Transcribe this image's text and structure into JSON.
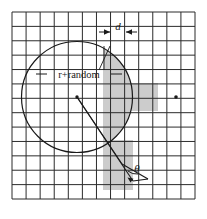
{
  "figure": {
    "name": "circle-sampling-diagram",
    "background_color": "#ffffff",
    "grid": {
      "x0": 12,
      "y0": 12,
      "x1": 195,
      "y1": 199,
      "columns": 13,
      "rows": 13,
      "cell_size": 14.08,
      "line_color": "#2b2b2b",
      "line_width": 1.0
    },
    "circle": {
      "center_x": 77,
      "center_y": 97,
      "radius": 55.5,
      "stroke_color": "#1a1a1a",
      "stroke_width": 1.1,
      "fill": "none"
    },
    "shaded_band": {
      "x_left": 103,
      "x_right": 133,
      "fill_color": "#c9c9c9",
      "description": "vertical strip of width d clipped to the circle and extended below"
    },
    "center_dot": {
      "x": 77,
      "y": 97,
      "radius": 1.6,
      "color": "#1a1a1a"
    },
    "grid_dot": {
      "x": 176,
      "y": 97,
      "radius": 1.7,
      "color": "#1a1a1a"
    },
    "labels": {
      "d": "d",
      "r_random": "r+random",
      "theta": "θ"
    },
    "d_dimension": {
      "y": 32,
      "x_left": 103,
      "x_right": 133,
      "label_x": 118,
      "label_y": 29
    },
    "r_random_label": {
      "x": 72,
      "y": 77,
      "leader_left_x": 36,
      "leader_right_x": 121
    },
    "theta_label": {
      "x": 139,
      "y": 167
    },
    "wedge": {
      "apex_x": 77,
      "apex_y": 97,
      "ray_a_x": 131,
      "ray_a_y": 178,
      "ray_b_x": 121,
      "ray_b_y": 163,
      "stroke_color": "#1a1a1a"
    },
    "callout_lines": [
      {
        "from_x": 100,
        "from_y": 68,
        "to_x": 108,
        "to_y": 45
      },
      {
        "from_x": 104,
        "from_y": 68,
        "to_x": 104,
        "to_y": 45
      }
    ],
    "arrow_color": "#1a1a1a"
  }
}
